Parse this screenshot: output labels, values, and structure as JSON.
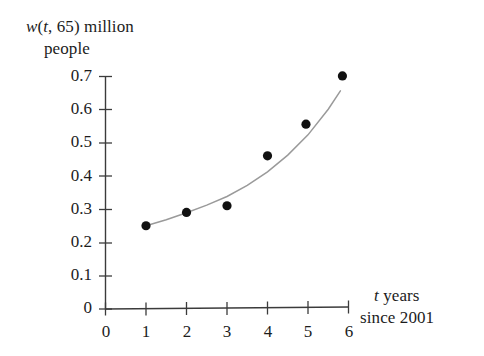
{
  "chart_data": {
    "type": "scatter",
    "title": "",
    "ylabel_line1": "w(t, 65) million",
    "ylabel_line2": "people",
    "xlabel_line1": "t years",
    "xlabel_line2": "since 2001",
    "xlabel": "t years since 2001",
    "ylabel": "w(t, 65) million people",
    "xlim": [
      0,
      6
    ],
    "ylim": [
      0,
      0.7
    ],
    "grid": false,
    "legend": "none",
    "x_ticks": [
      "0",
      "1",
      "2",
      "3",
      "4",
      "5",
      "6"
    ],
    "y_ticks": [
      "0",
      "0.1",
      "0.2",
      "0.3",
      "0.4",
      "0.5",
      "0.6",
      "0.7"
    ],
    "x_tick_values": [
      0,
      1,
      2,
      3,
      4,
      5,
      6
    ],
    "y_tick_values": [
      0,
      0.1,
      0.2,
      0.3,
      0.4,
      0.5,
      0.6,
      0.7
    ],
    "points": [
      {
        "x": 1,
        "y": 0.25
      },
      {
        "x": 2,
        "y": 0.29
      },
      {
        "x": 3,
        "y": 0.31
      },
      {
        "x": 4,
        "y": 0.46
      },
      {
        "x": 4.95,
        "y": 0.555
      },
      {
        "x": 5.85,
        "y": 0.7
      }
    ],
    "series": [
      {
        "name": "data points",
        "marker": "filled-circle",
        "color": "#111111",
        "x": [
          1,
          2,
          3,
          4,
          4.95,
          5.85
        ],
        "values": [
          0.25,
          0.29,
          0.31,
          0.46,
          0.555,
          0.7
        ]
      },
      {
        "name": "fitted exponential curve",
        "marker": "none",
        "color": "#9a9a9a",
        "x": [
          1,
          1.5,
          2,
          2.5,
          3,
          3.5,
          4,
          4.5,
          5,
          5.5,
          5.8
        ],
        "values": [
          0.25,
          0.268,
          0.289,
          0.312,
          0.338,
          0.371,
          0.412,
          0.462,
          0.523,
          0.6,
          0.655
        ]
      }
    ],
    "curve_color": "#9a9a9a",
    "point_color": "#111111",
    "axis_color": "#3b3b3b",
    "background": "#ffffff"
  },
  "icons": {
    "data_point": "filled-circle-marker"
  }
}
